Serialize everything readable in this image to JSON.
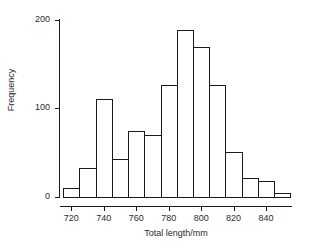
{
  "chart_data": {
    "type": "bar",
    "title": "",
    "subtitle": "",
    "xlabel": "Total length/mm",
    "ylabel": "Frequency",
    "bin_width": 10,
    "bin_edges": [
      715,
      725,
      735,
      745,
      755,
      765,
      775,
      785,
      795,
      805,
      815,
      825,
      835,
      845,
      855
    ],
    "categories": [
      "715-725",
      "725-735",
      "735-745",
      "745-755",
      "755-765",
      "765-775",
      "775-785",
      "785-795",
      "795-805",
      "805-815",
      "815-825",
      "825-835",
      "835-845",
      "845-855"
    ],
    "values": [
      10,
      33,
      110,
      43,
      74,
      70,
      126,
      188,
      169,
      126,
      51,
      21,
      18,
      4
    ],
    "xlim": [
      713,
      856
    ],
    "ylim": [
      0,
      200
    ],
    "xticks": [
      720,
      740,
      760,
      780,
      800,
      820,
      840
    ],
    "xtick_labels": [
      "720",
      "740",
      "760",
      "780",
      "800",
      "820",
      "840"
    ],
    "yticks": [
      0,
      100,
      200
    ],
    "ytick_labels": [
      "0",
      "100",
      "200"
    ],
    "grid": false,
    "legend": false,
    "bar_fill": "#ffffff",
    "bar_edge_color": "#1a1a1a",
    "axis_color": "#1a1a1a",
    "background": "#ffffff"
  },
  "axes": {
    "y_title": "Frequency",
    "x_title": "Total length/mm"
  }
}
